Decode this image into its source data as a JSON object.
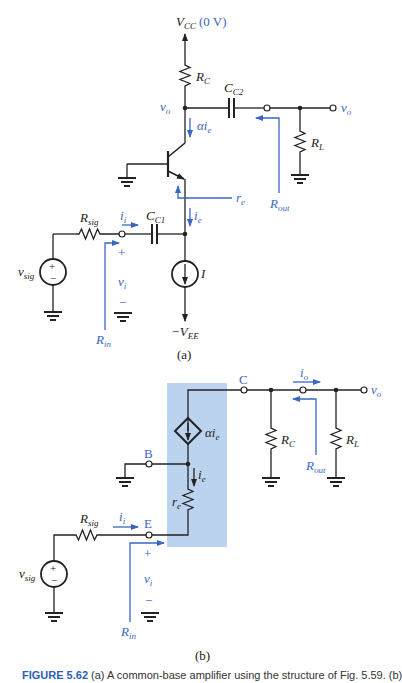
{
  "figure_a": {
    "vcc_label": "V",
    "vcc_sub": "CC",
    "vcc_value": "(0 V)",
    "rc_label": "R",
    "rc_sub": "C",
    "cc2_label": "C",
    "cc2_sub": "C2",
    "vo_node_label": "v",
    "vo_node_sub": "o",
    "vo_out_label": "v",
    "vo_out_sub": "o",
    "alpha_ie_label": "αi",
    "alpha_ie_sub": "e",
    "re_label": "r",
    "re_sub": "e",
    "rl_label": "R",
    "rl_sub": "L",
    "rout_label": "R",
    "rout_sub": "out",
    "rsig_label": "R",
    "rsig_sub": "sig",
    "ii_label": "i",
    "ii_sub": "i",
    "cc1_label": "C",
    "cc1_sub": "C1",
    "ie_label": "i",
    "ie_sub": "e",
    "vsig_label": "v",
    "vsig_sub": "sig",
    "vi_label": "v",
    "vi_sub": "i",
    "plus": "+",
    "minus": "−",
    "i_source_label": "I",
    "vee_label": "−V",
    "vee_sub": "EE",
    "rin_label": "R",
    "rin_sub": "in",
    "panel_label": "(a)"
  },
  "figure_b": {
    "c_terminal": "C",
    "b_terminal": "B",
    "e_terminal": "E",
    "io_label": "i",
    "io_sub": "o",
    "vo_label": "v",
    "vo_sub": "o",
    "alpha_ie_label": "αi",
    "alpha_ie_sub": "e",
    "ie_label": "i",
    "ie_sub": "e",
    "re_label": "r",
    "re_sub": "e",
    "rc_label": "R",
    "rc_sub": "C",
    "rl_label": "R",
    "rl_sub": "L",
    "rout_label": "R",
    "rout_sub": "out",
    "rsig_label": "R",
    "rsig_sub": "sig",
    "ii_label": "i",
    "ii_sub": "i",
    "vsig_label": "v",
    "vsig_sub": "sig",
    "vi_label": "v",
    "vi_sub": "i",
    "plus": "+",
    "minus": "−",
    "rin_label": "R",
    "rin_sub": "in",
    "panel_label": "(b)"
  },
  "colors": {
    "accent_blue": "#3a66c4",
    "shade_box": "#bcd3f0",
    "wire": "#222222"
  },
  "caption": {
    "figure_number": "FIGURE 5.62",
    "text": "(a) A common-base amplifier using the structure of Fig. 5.59. (b)"
  }
}
